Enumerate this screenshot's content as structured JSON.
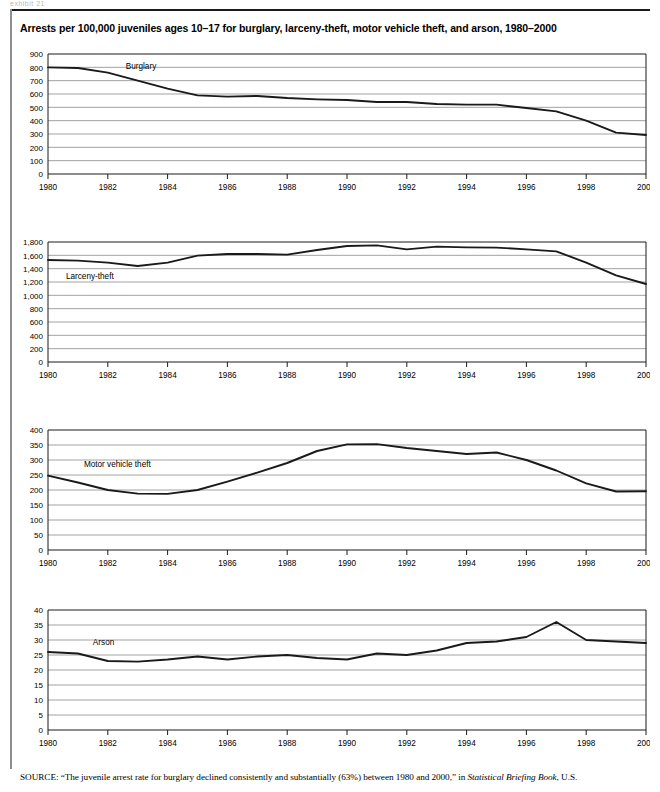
{
  "document": {
    "cut_top_text": "exhibit 21",
    "title": "Arrests per 100,000 juveniles ages 10–17 for burglary, larceny-theft, motor vehicle theft, and arson, 1980–2000",
    "source_label": "SOURCE:",
    "source_text_part1": "“The juvenile arrest rate for burglary declined consistently and substantially (63%) between 1980 and 2000,” in ",
    "source_italic": "Statistical Briefing Book",
    "source_text_part2": ", U.S."
  },
  "colors": {
    "line": "#1a1a1a",
    "grid": "#8a8a8a",
    "axis": "#1a1a1a",
    "text": "#000000",
    "rule": "#1a1a1a"
  },
  "axis": {
    "x_ticks": [
      "1980",
      "1982",
      "1984",
      "1986",
      "1988",
      "1990",
      "1992",
      "1994",
      "1996",
      "1998",
      "2000"
    ],
    "x_min": 1980,
    "x_max": 2000,
    "x_tick_step": 2
  },
  "chart_data": [
    {
      "type": "line",
      "title": "Burglary",
      "series_label": "Burglary",
      "xlabel": "",
      "ylabel": "",
      "ylim": [
        0,
        900
      ],
      "ytick_step": 100,
      "ytick_labels": [
        "0",
        "100",
        "200",
        "300",
        "400",
        "500",
        "600",
        "700",
        "800",
        "900"
      ],
      "grid": true,
      "legend_position": "inline",
      "x": [
        1980,
        1981,
        1982,
        1983,
        1984,
        1985,
        1986,
        1987,
        1988,
        1989,
        1990,
        1991,
        1992,
        1993,
        1994,
        1995,
        1996,
        1997,
        1998,
        1999,
        2000
      ],
      "values": [
        800,
        795,
        760,
        700,
        640,
        590,
        580,
        585,
        570,
        560,
        555,
        540,
        540,
        525,
        520,
        520,
        495,
        470,
        400,
        310,
        293
      ]
    },
    {
      "type": "line",
      "title": "Larceny-theft",
      "series_label": "Larceny-theft",
      "xlabel": "",
      "ylabel": "",
      "ylim": [
        0,
        1800
      ],
      "ytick_step": 200,
      "ytick_labels": [
        "0",
        "200",
        "400",
        "600",
        "800",
        "1,000",
        "1,200",
        "1,400",
        "1,600",
        "1,800"
      ],
      "grid": true,
      "legend_position": "inline",
      "x": [
        1980,
        1981,
        1982,
        1983,
        1984,
        1985,
        1986,
        1987,
        1988,
        1989,
        1990,
        1991,
        1992,
        1993,
        1994,
        1995,
        1996,
        1997,
        1998,
        1999,
        2000
      ],
      "values": [
        1530,
        1520,
        1490,
        1440,
        1490,
        1595,
        1620,
        1620,
        1610,
        1680,
        1740,
        1750,
        1690,
        1730,
        1720,
        1715,
        1690,
        1660,
        1490,
        1300,
        1170
      ]
    },
    {
      "type": "line",
      "title": "Motor vehicle theft",
      "series_label": "Motor vehicle theft",
      "xlabel": "",
      "ylabel": "",
      "ylim": [
        0,
        400
      ],
      "ytick_step": 50,
      "ytick_labels": [
        "0",
        "50",
        "100",
        "150",
        "200",
        "250",
        "300",
        "350",
        "400"
      ],
      "grid": true,
      "legend_position": "inline",
      "x": [
        1980,
        1981,
        1982,
        1983,
        1984,
        1985,
        1986,
        1987,
        1988,
        1989,
        1990,
        1991,
        1992,
        1993,
        1994,
        1995,
        1996,
        1997,
        1998,
        1999,
        2000
      ],
      "values": [
        248,
        225,
        200,
        188,
        187,
        200,
        228,
        258,
        290,
        330,
        352,
        353,
        340,
        330,
        320,
        325,
        300,
        265,
        222,
        195,
        196
      ]
    },
    {
      "type": "line",
      "title": "Arson",
      "series_label": "Arson",
      "xlabel": "",
      "ylabel": "",
      "ylim": [
        0,
        40
      ],
      "ytick_step": 5,
      "ytick_labels": [
        "0",
        "5",
        "10",
        "15",
        "20",
        "25",
        "30",
        "35",
        "40"
      ],
      "grid": true,
      "legend_position": "inline",
      "x": [
        1980,
        1981,
        1982,
        1983,
        1984,
        1985,
        1986,
        1987,
        1988,
        1989,
        1990,
        1991,
        1992,
        1993,
        1994,
        1995,
        1996,
        1997,
        1998,
        1999,
        2000
      ],
      "values": [
        26,
        25.5,
        23,
        22.8,
        23.5,
        24.5,
        23.5,
        24.5,
        25,
        24,
        23.5,
        25.5,
        25,
        26.5,
        29,
        29.5,
        31,
        36,
        30,
        29.5,
        29
      ]
    }
  ],
  "panels": [
    {
      "label_x": 1982.6,
      "label_y_value": 790
    },
    {
      "label_x": 1980.6,
      "label_y_value": 1250
    },
    {
      "label_x": 1981.2,
      "label_y_value": 278
    },
    {
      "label_x": 1981.5,
      "label_y_value": 28.5
    }
  ]
}
